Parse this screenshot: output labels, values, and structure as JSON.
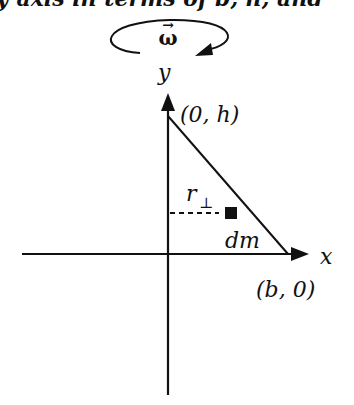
{
  "header_text": "y  axis in terms of b, h, and",
  "rotation": {
    "symbol": "ω",
    "vector_arrow": "→"
  },
  "axes": {
    "x_label": "x",
    "y_label": "y"
  },
  "points": {
    "apex": "(0, h)",
    "base": "(b, 0)"
  },
  "element": {
    "mass_label": "dm",
    "distance_label": "r",
    "distance_subscript": "⊥"
  }
}
